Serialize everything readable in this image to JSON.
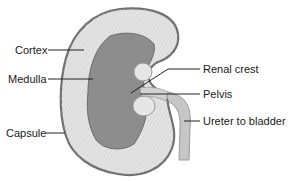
{
  "diagram": {
    "labels": {
      "cortex": "Cortex",
      "medulla": "Medulla",
      "capsule": "Capsule",
      "renal_crest": "Renal crest",
      "pelvis": "Pelvis",
      "ureter": "Ureter to bladder"
    },
    "colors": {
      "capsule": "#6e6e6e",
      "cortex": "#e2e2e2",
      "medulla": "#8f8f8f",
      "pelvis": "#d6d6d6",
      "ureter": "#c4c4c4",
      "leader_line": "#222222"
    }
  }
}
